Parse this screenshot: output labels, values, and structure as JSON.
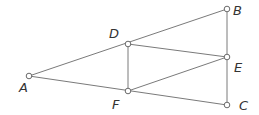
{
  "diagram": {
    "type": "geometry",
    "stroke_color": "#7a7a7a",
    "point_fill": "#ffffff",
    "label_color": "#333333",
    "points": {
      "A": {
        "x": 29,
        "y": 76,
        "label": "A",
        "lx": 19,
        "ly": 92
      },
      "D": {
        "x": 128,
        "y": 44,
        "label": "D",
        "lx": 109,
        "ly": 38
      },
      "F": {
        "x": 128,
        "y": 91,
        "label": "F",
        "lx": 112,
        "ly": 109
      },
      "B": {
        "x": 227,
        "y": 9,
        "label": "B",
        "lx": 233,
        "ly": 15
      },
      "E": {
        "x": 227,
        "y": 57,
        "label": "E",
        "lx": 234,
        "ly": 72
      },
      "C": {
        "x": 227,
        "y": 105,
        "label": "C",
        "lx": 239,
        "ly": 110
      }
    },
    "segments": [
      [
        "A",
        "B"
      ],
      [
        "A",
        "C"
      ],
      [
        "B",
        "C"
      ],
      [
        "D",
        "F"
      ],
      [
        "D",
        "E"
      ],
      [
        "F",
        "E"
      ]
    ]
  }
}
